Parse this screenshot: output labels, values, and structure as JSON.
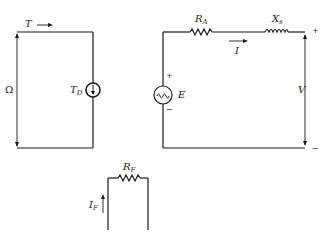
{
  "diagram": {
    "type": "equivalent circuit of synchronous machine",
    "mechanical_circuit": {
      "torque_label": "T",
      "speed_label": "Ω",
      "source_label": "T",
      "source_sub": "D"
    },
    "armature_circuit": {
      "resistor_label": "R",
      "resistor_sub": "A",
      "reactance_label": "X",
      "reactance_sub": "s",
      "current_label": "I",
      "emf_label": "E",
      "emf_plus": "+",
      "emf_minus": "−",
      "voltage_label": "V",
      "terminal_plus": "+",
      "terminal_minus": "−"
    },
    "field_circuit": {
      "resistor_label": "R",
      "resistor_sub": "F",
      "current_label": "I",
      "current_sub": "F"
    },
    "colors": {
      "line": "#1a1a1a",
      "background": "#ffffff"
    }
  }
}
